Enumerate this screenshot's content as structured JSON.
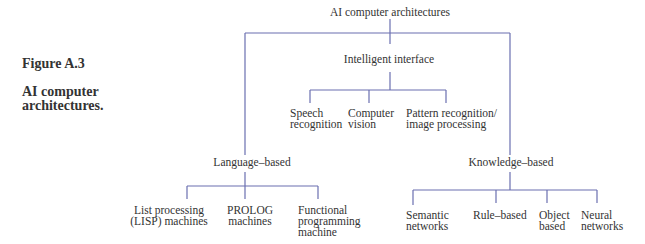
{
  "caption": {
    "number": "Figure A.3",
    "title": "AI computer architectures."
  },
  "diagram": {
    "line_color": "#6a6fb0",
    "root": "AI computer architectures",
    "interface": {
      "label": "Intelligent interface",
      "children": [
        "Speech recognition",
        "Computer vision",
        "Pattern recognition/ image processing"
      ]
    },
    "language": {
      "label": "Language–based",
      "children": [
        "List processing (LISP) machines",
        "PROLOG machines",
        "Functional programming machine"
      ]
    },
    "knowledge": {
      "label": "Knowledge–based",
      "children": [
        "Semantic networks",
        "Rule–based",
        "Object based",
        "Neural networks"
      ]
    }
  },
  "labels": {
    "speech_1": "Speech",
    "speech_2": "recognition",
    "vision_1": "Computer",
    "vision_2": "vision",
    "pattern_1": "Pattern recognition/",
    "pattern_2": "image processing",
    "lisp_1": "List processing",
    "lisp_2": "(LISP) machines",
    "prolog_1": "PROLOG",
    "prolog_2": "machines",
    "func_1": "Functional",
    "func_2": "programming",
    "func_3": "machine",
    "sem_1": "Semantic",
    "sem_2": "networks",
    "rule": "Rule–based",
    "obj_1": "Object",
    "obj_2": "based",
    "neural_1": "Neural",
    "neural_2": "networks"
  }
}
